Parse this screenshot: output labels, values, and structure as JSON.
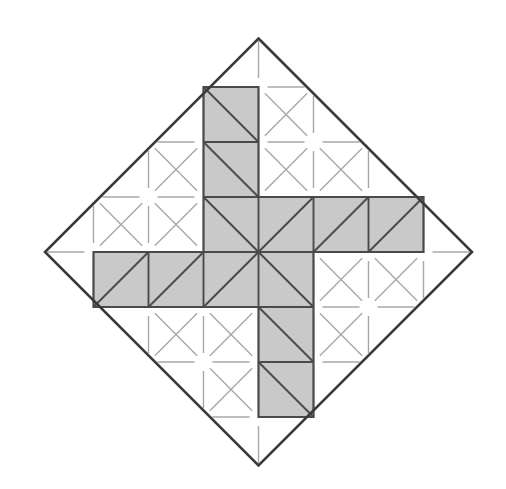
{
  "figure": {
    "title": "Pinwheel polyomino dissection inscribed in a rotated square",
    "type": "geometric-diagram",
    "canvas": {
      "width": 506,
      "height": 489,
      "background": "#ffffff"
    },
    "grid": {
      "cell_size": 55,
      "origin_x": 38.5,
      "origin_y": 32,
      "columns": 8,
      "rows": 8,
      "description": "Square lattice of 55px cells aligned to the inscribed-square dissection"
    },
    "outer_square": {
      "name": "rotated-square-boundary",
      "rotation_deg": 45,
      "center": {
        "x": 258.5,
        "y": 252.0
      },
      "half_diagonal": 213.5,
      "vertices": [
        {
          "x": 258.5,
          "y": 38.5
        },
        {
          "x": 472.0,
          "y": 252.0
        },
        {
          "x": 258.5,
          "y": 465.5
        },
        {
          "x": 45.0,
          "y": 252.0
        }
      ],
      "stroke": "#3a3a3a",
      "stroke_width": 2.6,
      "fill": "none"
    },
    "shaded_shape": {
      "name": "pinwheel-polyomino",
      "cell_count": 12,
      "fill": "#c9c9c9",
      "stroke": "#4a4a4a",
      "stroke_width": 2.2,
      "description": "Four congruent 3x1 arms arranged with 90-degree rotational symmetry about the centre, forming a swastika/pinwheel hexadecagon",
      "outline_points": [
        {
          "x": 203.5,
          "y": 87.0
        },
        {
          "x": 258.5,
          "y": 87.0
        },
        {
          "x": 258.5,
          "y": 197.0
        },
        {
          "x": 423.5,
          "y": 197.0
        },
        {
          "x": 423.5,
          "y": 252.0
        },
        {
          "x": 313.5,
          "y": 252.0
        },
        {
          "x": 313.5,
          "y": 417.0
        },
        {
          "x": 258.5,
          "y": 417.0
        },
        {
          "x": 258.5,
          "y": 307.0
        },
        {
          "x": 93.5,
          "y": 307.0
        },
        {
          "x": 93.5,
          "y": 252.0
        },
        {
          "x": 203.5,
          "y": 252.0
        }
      ],
      "arms": [
        {
          "name": "top-arm",
          "x": 203.5,
          "y": 87.0,
          "w": 55,
          "h": 165
        },
        {
          "name": "right-arm",
          "x": 258.5,
          "y": 197.0,
          "w": 165,
          "h": 55
        },
        {
          "name": "bottom-arm",
          "x": 258.5,
          "y": 252.0,
          "w": 55,
          "h": 165
        },
        {
          "name": "left-arm",
          "x": 93.5,
          "y": 252.0,
          "w": 165,
          "h": 55
        }
      ]
    },
    "dark_internal_lines": {
      "name": "dissection-lines",
      "stroke": "#4a4a4a",
      "stroke_width": 1.9,
      "note": "Cell edges and one diagonal per unit cell inside the shaded pinwheel"
    },
    "faint_lattice": {
      "name": "background-lattice",
      "stroke": "#a8a8a8",
      "stroke_width": 1.4,
      "gap": 9,
      "note": "Light grey broken grid lines and both diagonals drawn through the unshaded region, clipped to the rotated square"
    },
    "legend": {
      "visible": false,
      "entries": []
    },
    "labels": []
  },
  "chart_data": {
    "type": "table",
    "title": "Pinwheel polyomino dissection inscribed in a rotated square",
    "categories": [
      "top-arm",
      "right-arm",
      "bottom-arm",
      "left-arm"
    ],
    "values": [
      3,
      3,
      3,
      3
    ],
    "xlabel": "arm",
    "ylabel": "unit cells per arm",
    "annotations": [
      "12 shaded unit cells total",
      "each unit cell is 55 x 55 px",
      "outer boundary is a square rotated 45 degrees",
      "four-fold rotational symmetry about the centre point"
    ]
  }
}
